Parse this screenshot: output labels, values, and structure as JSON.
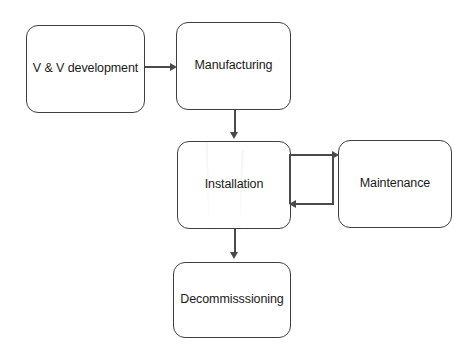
{
  "diagram": {
    "background_color": "#ffffff",
    "node_border_color": "#3f3f3f",
    "edge_color": "#4a4a4a",
    "nodes": [
      {
        "id": "vv",
        "label": "V & V development",
        "x": 26,
        "y": 25,
        "w": 119,
        "h": 88
      },
      {
        "id": "manufacturing",
        "label": "Manufacturing",
        "x": 176,
        "y": 22,
        "w": 115,
        "h": 88
      },
      {
        "id": "installation",
        "label": "Installation",
        "x": 177,
        "y": 141,
        "w": 114,
        "h": 88
      },
      {
        "id": "maintenance",
        "label": "Maintenance",
        "x": 338,
        "y": 140,
        "w": 114,
        "h": 88
      },
      {
        "id": "decommissioning",
        "label": "Decommisssioning",
        "x": 173,
        "y": 262,
        "w": 118,
        "h": 76
      }
    ],
    "edges": [
      {
        "id": "vv-to-manufacturing",
        "from": "vv",
        "to": "manufacturing",
        "direction": "right"
      },
      {
        "id": "manufacturing-to-installation",
        "from": "manufacturing",
        "to": "installation",
        "direction": "down"
      },
      {
        "id": "installation-to-maintenance",
        "from": "installation",
        "to": "maintenance",
        "direction": "right"
      },
      {
        "id": "maintenance-to-installation",
        "from": "maintenance",
        "to": "installation",
        "direction": "left"
      },
      {
        "id": "installation-to-decommissioning",
        "from": "installation",
        "to": "decommissioning",
        "direction": "down"
      }
    ]
  }
}
